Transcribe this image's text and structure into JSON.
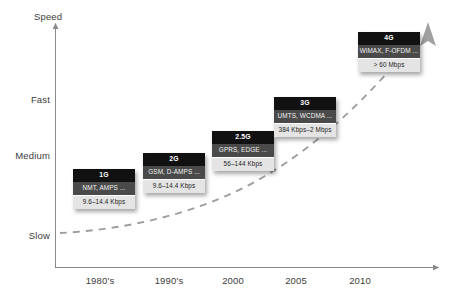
{
  "diagram": {
    "title_axis_y": "Speed",
    "y_ticks": [
      {
        "label": "Fast",
        "y": 100
      },
      {
        "label": "Medium",
        "y": 156
      },
      {
        "label": "Slow",
        "y": 236
      }
    ],
    "x_ticks": [
      {
        "label": "1980's",
        "x": 100
      },
      {
        "label": "1990's",
        "x": 169
      },
      {
        "label": "2000",
        "x": 233
      },
      {
        "label": "2005",
        "x": 296
      },
      {
        "label": "2010",
        "x": 360
      }
    ],
    "generations": [
      {
        "name": "1G",
        "technologies": "NMT, AMPS ...",
        "speed": "9.6–14.4 Kbps",
        "x": 73,
        "y": 169
      },
      {
        "name": "2G",
        "technologies": "GSM, D-AMPS ...",
        "speed": "9.6–14.4 Kbps",
        "x": 143,
        "y": 153
      },
      {
        "name": "2.5G",
        "technologies": "GPRS, EDGE ...",
        "speed": "56–144 Kbps",
        "x": 212,
        "y": 131
      },
      {
        "name": "3G",
        "technologies": "UMTS, WCDMA ...",
        "speed": "384 Kbps–2 Mbps",
        "x": 274,
        "y": 97
      },
      {
        "name": "4G",
        "technologies": "WiMAX, F-OFDM ...",
        "speed": "> 60 Mbps",
        "x": 358,
        "y": 32
      }
    ],
    "colors": {
      "axis": "#8a8a8a",
      "trend_curve": "#9a9a9a",
      "box_title_bg": "#111111",
      "box_tech_bg": "#4a4a4a",
      "box_speed_bg": "#e4e4e4",
      "text_dark": "#3c3c3c",
      "background": "#ffffff"
    },
    "trend": {
      "name": "growth-trend-curve",
      "style": "dashed",
      "direction": "increasing-exponential"
    }
  }
}
